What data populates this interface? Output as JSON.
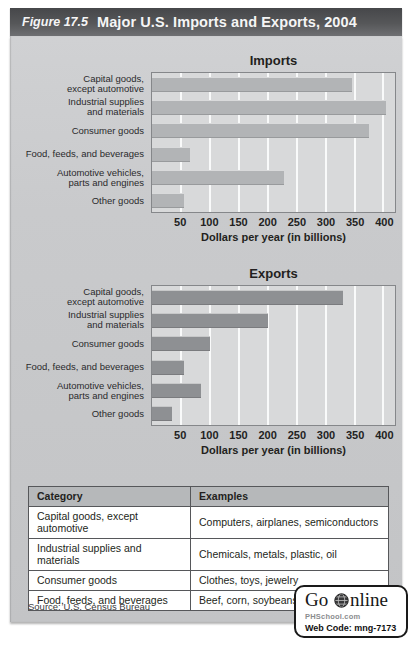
{
  "figure": {
    "label": "Figure 17.5",
    "title": "Major U.S. Imports and Exports, 2004"
  },
  "chart_data": [
    {
      "type": "bar",
      "orientation": "horizontal",
      "title": "Imports",
      "categories": [
        "Capital goods,\nexcept automotive",
        "Industrial supplies\nand materials",
        "Consumer goods",
        "Food, feeds, and beverages",
        "Automotive vehicles,\nparts and engines",
        "Other goods"
      ],
      "values": [
        345,
        405,
        375,
        65,
        228,
        55
      ],
      "xlabel": "Dollars per year (in billions)",
      "xlim": [
        0,
        420
      ],
      "xticks": [
        50,
        100,
        150,
        200,
        250,
        300,
        350,
        400
      ],
      "grid": "vertical white gridlines"
    },
    {
      "type": "bar",
      "orientation": "horizontal",
      "title": "Exports",
      "categories": [
        "Capital goods,\nexcept automotive",
        "Industrial supplies\nand materials",
        "Consumer goods",
        "Food, feeds, and beverages",
        "Automotive vehicles,\nparts and engines",
        "Other goods"
      ],
      "values": [
        330,
        200,
        100,
        55,
        85,
        35
      ],
      "xlabel": "Dollars per year (in billions)",
      "xlim": [
        0,
        420
      ],
      "xticks": [
        50,
        100,
        150,
        200,
        250,
        300,
        350,
        400
      ],
      "grid": "vertical white gridlines"
    }
  ],
  "table": {
    "headers": [
      "Category",
      "Examples"
    ],
    "rows": [
      [
        "Capital goods, except automotive",
        "Computers, airplanes, semiconductors"
      ],
      [
        "Industrial supplies and materials",
        "Chemicals, metals, plastic, oil"
      ],
      [
        "Consumer goods",
        "Clothes, toys, jewelry"
      ],
      [
        "Food, feeds, and beverages",
        "Beef, corn, soybeans"
      ]
    ]
  },
  "footer": {
    "source": "Source: U.S. Census Bureau",
    "badge": {
      "go_text": "Go",
      "online_text": "nline",
      "icon": "globe-icon",
      "site": "PHSchool.com",
      "web_code": "Web Code: mng-7173"
    }
  },
  "colors": {
    "title_bar": "#565759",
    "title_text": "#f5f5f5",
    "panel_bg": "#c9cacc",
    "plot_bg": "#d8d9da",
    "plot_border": "#85878a",
    "grid_line": "#ffffff",
    "import_bar": "#b2b4b6",
    "export_bar": "#8e9093",
    "table_border": "#56575a",
    "table_header_bg": "#b6b8ba",
    "table_cell_bg": "#ffffff",
    "text_dark": "#231f20",
    "badge_border": "#1a1a1a",
    "badge_site_text": "#8a8c8e"
  }
}
